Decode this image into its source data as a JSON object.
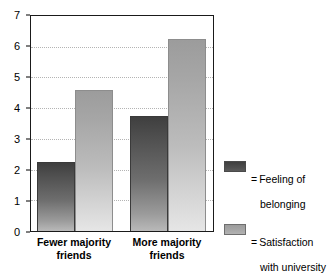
{
  "chart_data": {
    "type": "bar",
    "title": "",
    "xlabel": "",
    "ylabel": "",
    "ylim": [
      0,
      7
    ],
    "yticks": [
      0,
      1,
      2,
      3,
      4,
      5,
      6,
      7
    ],
    "ytick_labels": [
      "0",
      "1",
      "2",
      "3",
      "4",
      "5",
      "6",
      "7"
    ],
    "grid": true,
    "grid_style": "dotted horizontal",
    "legend_position": "right",
    "categories": [
      "Fewer majority friends",
      "More majority friends"
    ],
    "category_lines": [
      [
        "Fewer majority",
        "friends"
      ],
      [
        "More majority",
        "friends"
      ]
    ],
    "series": [
      {
        "name": "Feeling of belonging",
        "legend_label": "= Feeling of belonging",
        "legend_lines": [
          "= Feeling of",
          "belonging"
        ],
        "color": "#4a4a4a",
        "values": [
          2.25,
          3.75
        ]
      },
      {
        "name": "Satisfaction with university",
        "legend_label": "= Satisfaction with university",
        "legend_lines": [
          "= Satisfaction",
          "with university"
        ],
        "color": "#a8a8a8",
        "values": [
          4.6,
          6.25
        ]
      }
    ]
  },
  "legend": {
    "entries": [
      {
        "equals": "=",
        "label_line1": "Feeling of",
        "label_line2": "belonging",
        "swatch": "dark-gray-swatch"
      },
      {
        "equals": "=",
        "label_line1": "Satisfaction",
        "label_line2": "with university",
        "swatch": "light-gray-swatch"
      }
    ]
  },
  "axis": {
    "y_labels": [
      "7",
      "6",
      "5",
      "4",
      "3",
      "2",
      "1",
      "0"
    ]
  },
  "x_labels": [
    {
      "line1": "Fewer majority",
      "line2": "friends"
    },
    {
      "line1": "More majority",
      "line2": "friends"
    }
  ],
  "colors": {
    "bar_dark": "#4a4a4a",
    "bar_light": "#a8a8a8",
    "frame": "#1a1a1a",
    "gridline": "#b4b4b4",
    "background": "#ffffff"
  }
}
